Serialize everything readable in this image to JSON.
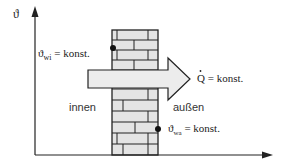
{
  "diagram": {
    "y_axis_label": "ϑ",
    "inner_temp": {
      "symbol": "ϑ",
      "subscript": "wi",
      "rest": " = konst."
    },
    "outer_temp": {
      "symbol": "ϑ",
      "subscript": "wa",
      "rest": " = konst."
    },
    "heat_flow": {
      "symbol": "Q",
      "rest": " = konst."
    },
    "inside_label": "innen",
    "outside_label": "außen",
    "colors": {
      "wall_fill": "#e4e4e4",
      "arrow_fill": "#ececec",
      "line": "#222222"
    }
  }
}
